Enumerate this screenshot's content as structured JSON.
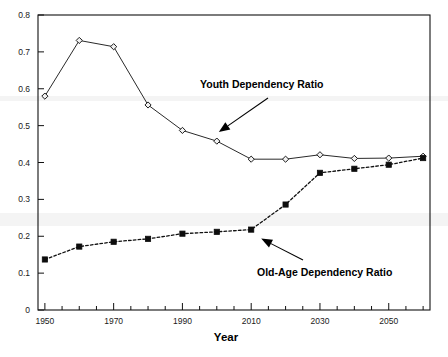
{
  "chart_data": {
    "type": "line",
    "title": "",
    "xlabel": "Year",
    "ylabel": "",
    "xlim": [
      1948,
      2062
    ],
    "ylim": [
      0,
      0.8
    ],
    "grid": false,
    "legend_position": "inline-annotations",
    "x": [
      1950,
      1960,
      1970,
      1980,
      1990,
      2000,
      2010,
      2020,
      2030,
      2040,
      2050,
      2060
    ],
    "xticks_major": [
      1950,
      1970,
      1990,
      2010,
      2030,
      2050
    ],
    "xticks_major_labels": [
      "1950",
      "1970",
      "1990",
      "2010",
      "2030",
      "2050"
    ],
    "xticks_minor": [
      1955,
      1960,
      1965,
      1975,
      1980,
      1985,
      1995,
      2000,
      2005,
      2015,
      2020,
      2025,
      2035,
      2040,
      2045,
      2055,
      2060
    ],
    "yticks": [
      0,
      0.1,
      0.2,
      0.3,
      0.4,
      0.5,
      0.6,
      0.7,
      0.8
    ],
    "ytick_labels": [
      "0",
      "0.1",
      "0.2",
      "0.3",
      "0.4",
      "0.5",
      "0.6",
      "0.7",
      "0.8"
    ],
    "series": [
      {
        "name": "Youth Dependency Ratio",
        "marker": "open-diamond",
        "linestyle": "solid",
        "color": "#2a2a2a",
        "values": [
          0.58,
          0.731,
          0.714,
          0.556,
          0.487,
          0.458,
          0.409,
          0.409,
          0.421,
          0.411,
          0.412,
          0.417
        ]
      },
      {
        "name": "Old-Age Dependency Ratio",
        "marker": "filled-square",
        "linestyle": "dotted",
        "color": "#0d0d0d",
        "values": [
          0.137,
          0.172,
          0.185,
          0.193,
          0.207,
          0.212,
          0.218,
          0.286,
          0.372,
          0.383,
          0.394,
          0.412
        ]
      }
    ],
    "annotations": [
      {
        "text": "Youth Dependency Ratio",
        "points_to_series": "Youth Dependency Ratio",
        "points_to_x": 2000
      },
      {
        "text": "Old-Age Dependency Ratio",
        "points_to_series": "Old-Age Dependency Ratio",
        "points_to_x": 2010
      }
    ]
  },
  "axes": {
    "x_title": "Year",
    "y_title": ""
  },
  "annotations": {
    "youth_label": "Youth Dependency Ratio",
    "oldage_label": "Old-Age Dependency Ratio"
  },
  "colors": {
    "youth": "#2a2a2a",
    "oldage": "#0d0d0d",
    "frame": "#111111",
    "background": "#ffffff"
  }
}
